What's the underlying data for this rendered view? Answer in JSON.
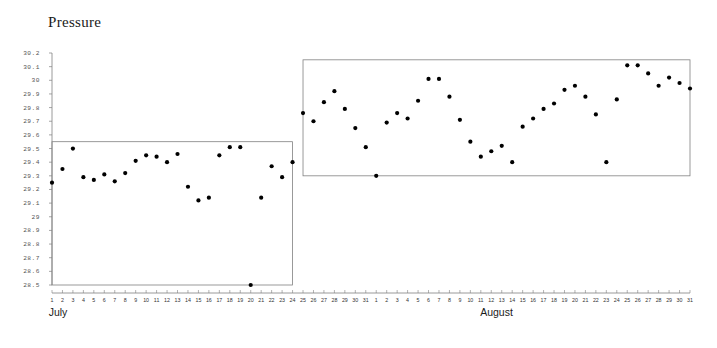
{
  "chart_data": {
    "type": "scatter",
    "title": "Pressure",
    "xlabel": "",
    "ylabel": "",
    "ylim": [
      28.5,
      30.2
    ],
    "ytick_step": 0.1,
    "ytick_labels": [
      "30.2",
      "30.1",
      "30",
      "29.9",
      "29.8",
      "29.7",
      "29.6",
      "29.5",
      "29.4",
      "29.3",
      "29.2",
      "29.1",
      "29",
      "28.9",
      "28.8",
      "28.7",
      "28.6",
      "28.5"
    ],
    "grid": false,
    "legend": null,
    "legend_position": "none",
    "marker": "filled-circle",
    "marker_color": "#000000",
    "box_color": "#808080",
    "axis_color": "#808080",
    "group_labels": [
      "July",
      "August"
    ],
    "xtick_labels": [
      "1",
      "2",
      "3",
      "4",
      "5",
      "6",
      "7",
      "8",
      "9",
      "10",
      "11",
      "12",
      "13",
      "14",
      "15",
      "16",
      "17",
      "18",
      "19",
      "20",
      "21",
      "22",
      "23",
      "24",
      "25",
      "26",
      "27",
      "28",
      "29",
      "30",
      "31",
      "1",
      "2",
      "3",
      "4",
      "5",
      "6",
      "7",
      "8",
      "9",
      "10",
      "11",
      "12",
      "13",
      "14",
      "15",
      "16",
      "17",
      "18",
      "19",
      "20",
      "21",
      "22",
      "23",
      "24",
      "25",
      "26",
      "27",
      "28",
      "29",
      "30",
      "31"
    ],
    "annotations": [
      {
        "label": "July box upper limit",
        "value": 29.55,
        "x_from": 1,
        "x_to": 24
      },
      {
        "label": "July box lower limit",
        "value": 28.5,
        "x_from": 1,
        "x_to": 24
      },
      {
        "label": "August box upper limit",
        "value": 30.15,
        "x_from": 25,
        "x_to": 62
      },
      {
        "label": "August box lower limit",
        "value": 29.3,
        "x_from": 25,
        "x_to": 62
      }
    ],
    "series": [
      {
        "name": "July",
        "month": "July",
        "x": [
          1,
          2,
          3,
          4,
          5,
          6,
          7,
          8,
          9,
          10,
          11,
          12,
          13,
          14,
          15,
          16,
          17,
          18,
          19,
          20,
          21,
          22,
          23,
          24
        ],
        "values": [
          29.25,
          29.35,
          29.5,
          29.29,
          29.27,
          29.31,
          29.26,
          29.32,
          29.41,
          29.45,
          29.44,
          29.4,
          29.46,
          29.22,
          29.12,
          29.14,
          29.45,
          29.51,
          29.51,
          28.5,
          29.14,
          29.37,
          29.29,
          29.4
        ]
      },
      {
        "name": "August",
        "month": "August",
        "x": [
          25,
          26,
          27,
          28,
          29,
          30,
          31,
          32,
          33,
          34,
          35,
          36,
          37,
          38,
          39,
          40,
          41,
          42,
          43,
          44,
          45,
          46,
          47,
          48,
          49,
          50,
          51,
          52,
          53,
          54,
          55,
          56,
          57,
          58,
          59,
          60,
          61,
          62
        ],
        "values": [
          29.76,
          29.7,
          29.84,
          29.92,
          29.79,
          29.65,
          29.51,
          29.3,
          29.69,
          29.76,
          29.72,
          29.85,
          30.01,
          30.01,
          29.88,
          29.71,
          29.55,
          29.44,
          29.48,
          29.52,
          29.4,
          29.66,
          29.72,
          29.79,
          29.83,
          29.93,
          29.96,
          29.88,
          29.75,
          29.4,
          29.86,
          30.11,
          30.11,
          30.05,
          29.96,
          30.02,
          29.98,
          29.94
        ]
      }
    ]
  },
  "axis": {
    "y_top_px": 53,
    "y_bottom_px": 285,
    "x_left_px": 52,
    "x_right_px": 690
  }
}
